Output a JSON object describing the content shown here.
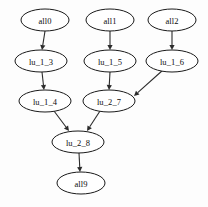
{
  "graph": {
    "type": "directed-acyclic-graph",
    "background_color": "#fdfdfd",
    "node_fill_color": "#ffffff",
    "node_stroke_color": "#1a1a1a",
    "edge_color": "#2b2b2b",
    "label_color": "#0d0d0d",
    "nodes": [
      {
        "id": "all0",
        "label": "all0",
        "cx": 45,
        "cy": 20,
        "rx": 24,
        "ry": 11
      },
      {
        "id": "all1",
        "label": "all1",
        "cx": 110,
        "cy": 20,
        "rx": 24,
        "ry": 11
      },
      {
        "id": "all2",
        "label": "all2",
        "cx": 172,
        "cy": 20,
        "rx": 24,
        "ry": 11
      },
      {
        "id": "lu_1_3",
        "label": "lu_1_3",
        "cx": 41,
        "cy": 61,
        "rx": 26,
        "ry": 11
      },
      {
        "id": "lu_1_5",
        "label": "lu_1_5",
        "cx": 110,
        "cy": 61,
        "rx": 26,
        "ry": 11
      },
      {
        "id": "lu_1_6",
        "label": "lu_1_6",
        "cx": 172,
        "cy": 61,
        "rx": 26,
        "ry": 11
      },
      {
        "id": "lu_1_4",
        "label": "lu_1_4",
        "cx": 45,
        "cy": 101,
        "rx": 26,
        "ry": 11
      },
      {
        "id": "lu_2_7",
        "label": "lu_2_7",
        "cx": 109,
        "cy": 101,
        "rx": 26,
        "ry": 11
      },
      {
        "id": "lu_2_8",
        "label": "lu_2_8",
        "cx": 78,
        "cy": 142,
        "rx": 26,
        "ry": 11
      },
      {
        "id": "all9",
        "label": "all9",
        "cx": 81,
        "cy": 183,
        "rx": 24,
        "ry": 11
      }
    ],
    "edges": [
      {
        "from": "all0",
        "to": "lu_1_3",
        "x1": 45,
        "y1": 31,
        "x2": 42,
        "y2": 50
      },
      {
        "from": "all1",
        "to": "lu_1_5",
        "x1": 110,
        "y1": 31,
        "x2": 110,
        "y2": 50
      },
      {
        "from": "all2",
        "to": "lu_1_6",
        "x1": 172,
        "y1": 31,
        "x2": 172,
        "y2": 50
      },
      {
        "from": "lu_1_3",
        "to": "lu_1_4",
        "x1": 42,
        "y1": 72,
        "x2": 44,
        "y2": 90
      },
      {
        "from": "lu_1_5",
        "to": "lu_2_7",
        "x1": 110,
        "y1": 72,
        "x2": 109,
        "y2": 90
      },
      {
        "from": "lu_1_6",
        "to": "lu_2_7",
        "x1": 163,
        "y1": 70,
        "x2": 134,
        "y2": 96
      },
      {
        "from": "lu_1_4",
        "to": "lu_2_8",
        "x1": 54,
        "y1": 111,
        "x2": 69,
        "y2": 131
      },
      {
        "from": "lu_2_7",
        "to": "lu_2_8",
        "x1": 100,
        "y1": 111,
        "x2": 87,
        "y2": 131
      },
      {
        "from": "lu_2_8",
        "to": "all9",
        "x1": 79,
        "y1": 153,
        "x2": 80,
        "y2": 172
      }
    ],
    "node_count": 10,
    "edge_count": 9
  }
}
